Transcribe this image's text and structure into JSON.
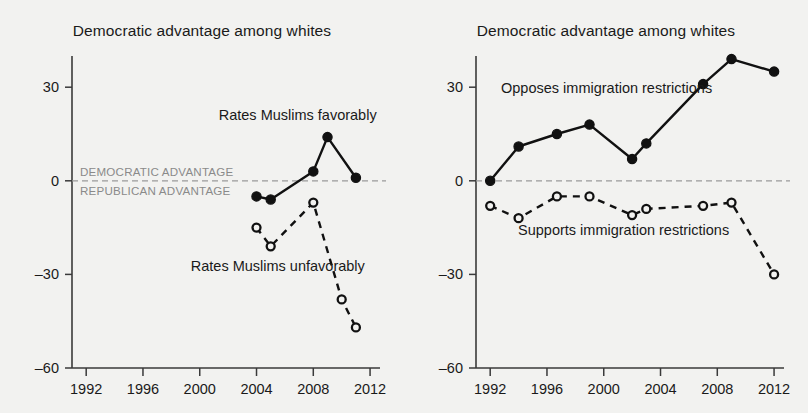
{
  "figure": {
    "background_color": "#f2f2f0",
    "ink_color": "#111111",
    "guide_color": "#9a9a9a",
    "note_color": "#8a8a8a"
  },
  "panels": [
    {
      "id": "left",
      "title": "Democratic advantage among whites",
      "axis": {
        "ylim": [
          -60,
          40
        ],
        "yticks": [
          30,
          0,
          -30,
          -60
        ],
        "ytick_labels": [
          "30",
          "0",
          "–30",
          "–60"
        ],
        "xlim": [
          1991,
          2012.7
        ],
        "xticks": [
          1992,
          1996,
          2000,
          2004,
          2008,
          2012
        ],
        "xtick_labels": [
          "1992",
          "1996",
          "2000",
          "2004",
          "2008",
          "2012"
        ],
        "grid": false
      },
      "zero_labels": {
        "above": "DEMOCRATIC ADVANTAGE",
        "below": "REPUBLICAN ADVANTAGE"
      },
      "annotations": [
        {
          "text": "Rates Muslims favorably",
          "x": 2006.9,
          "y": 19.5,
          "anchor": "middle"
        },
        {
          "text": "Rates Muslims unfavorably",
          "x": 2005.5,
          "y": -29.0,
          "anchor": "middle"
        }
      ]
    },
    {
      "id": "right",
      "title": "Democratic advantage among whites",
      "axis": {
        "ylim": [
          -60,
          40
        ],
        "yticks": [
          30,
          0,
          -30,
          -60
        ],
        "ytick_labels": [
          "30",
          "0",
          "–30",
          "–60"
        ],
        "xlim": [
          1991,
          2012.7
        ],
        "xticks": [
          1992,
          1996,
          2000,
          2004,
          2008,
          2012
        ],
        "xtick_labels": [
          "1992",
          "1996",
          "2000",
          "2004",
          "2008",
          "2012"
        ],
        "grid": false
      },
      "zero_labels": {
        "above": "",
        "below": ""
      },
      "annotations": [
        {
          "text": "Opposes immigration restrictions",
          "x": 2000.2,
          "y": 28.0,
          "anchor": "middle"
        },
        {
          "text": "Supports immigration restrictions",
          "x": 2001.4,
          "y": -17.5,
          "anchor": "middle"
        }
      ]
    }
  ],
  "chart_data": [
    {
      "type": "line",
      "panel": "left",
      "title": "Democratic advantage among whites",
      "xlabel": "",
      "ylabel": "",
      "xlim": [
        1991,
        2012.7
      ],
      "ylim": [
        -60,
        40
      ],
      "grid": false,
      "legend_position": "inline-annotations",
      "series": [
        {
          "name": "Rates Muslims favorably",
          "style": "solid",
          "marker": "filled-circle",
          "x": [
            2004,
            2005,
            2008,
            2009,
            2011
          ],
          "values": [
            -5,
            -6,
            3,
            14,
            1
          ]
        },
        {
          "name": "Rates Muslims unfavorably",
          "style": "dashed",
          "marker": "open-circle",
          "x": [
            2004,
            2005,
            2008,
            2010,
            2011
          ],
          "values": [
            -15,
            -21,
            -7,
            -38,
            -47
          ]
        }
      ]
    },
    {
      "type": "line",
      "panel": "right",
      "title": "Democratic advantage among whites",
      "xlabel": "",
      "ylabel": "",
      "xlim": [
        1991,
        2012.7
      ],
      "ylim": [
        -60,
        40
      ],
      "grid": false,
      "legend_position": "inline-annotations",
      "series": [
        {
          "name": "Opposes immigration restrictions",
          "style": "solid",
          "marker": "filled-circle",
          "x": [
            1992,
            1994,
            1996.7,
            1999,
            2002,
            2003,
            2007,
            2009,
            2012
          ],
          "values": [
            0,
            11,
            15,
            18,
            7,
            12,
            31,
            39,
            35
          ]
        },
        {
          "name": "Supports immigration restrictions",
          "style": "dashed",
          "marker": "open-circle",
          "x": [
            1992,
            1994,
            1996.7,
            1999,
            2002,
            2003,
            2007,
            2009,
            2012
          ],
          "values": [
            -8,
            -12,
            -5,
            -5,
            -11,
            -9,
            -8,
            -7,
            -30
          ]
        }
      ]
    }
  ]
}
